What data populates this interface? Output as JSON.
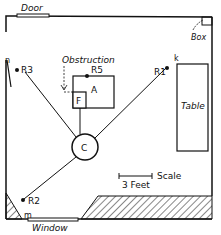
{
  "labels": {
    "door": "Door",
    "box": "Box",
    "obstruction": "Obstruction",
    "table": "Table",
    "window": "Window",
    "scale": "Scale",
    "scale_length": "3 Feet",
    "center": "C",
    "panel_a": "A",
    "panel_f": "F",
    "point_n": "n",
    "point_k": "k",
    "point_m": "m"
  },
  "reflectors": [
    {
      "id": "R1",
      "label": "R1"
    },
    {
      "id": "R2",
      "label": "R2"
    },
    {
      "id": "R3",
      "label": "R3"
    },
    {
      "id": "R5",
      "label": "R5"
    }
  ],
  "colors": {
    "ink": "#111111",
    "paper": "#ffffff"
  }
}
